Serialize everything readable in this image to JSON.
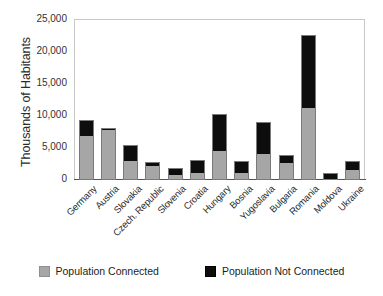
{
  "chart_data": {
    "type": "bar",
    "title": "",
    "xlabel": "",
    "ylabel": "Thousands of Habitants",
    "ylim": [
      0,
      25000
    ],
    "ytick_labels": [
      "25,000",
      "20,000",
      "15,000",
      "10,000",
      "5,000",
      "0"
    ],
    "ytick_values": [
      25000,
      20000,
      15000,
      10000,
      5000,
      0
    ],
    "grid": false,
    "stacked": true,
    "legend_position": "bottom",
    "categories": [
      "Germany",
      "Austria",
      "Slovakia",
      "Czech. Republic",
      "Slovenia",
      "Croatia",
      "Hungary",
      "Bosnia",
      "Yugoslavia",
      "Bulgaria",
      "Romania",
      "Moldova",
      "Ukraine"
    ],
    "series": [
      {
        "name": "Population Connected",
        "color": "#a6a6a6",
        "values": [
          6800,
          7800,
          2900,
          2200,
          800,
          1100,
          4500,
          1100,
          4000,
          2600,
          11200,
          0,
          1500
        ]
      },
      {
        "name": "Population Not Connected",
        "color": "#0d0d0d",
        "values": [
          2600,
          300,
          2500,
          600,
          1000,
          2100,
          5800,
          1800,
          5100,
          1300,
          11500,
          1100,
          1400
        ]
      }
    ],
    "totals": [
      9400,
      8100,
      5400,
      2800,
      1800,
      3200,
      10300,
      2900,
      9100,
      3900,
      22700,
      1100,
      2900
    ]
  },
  "legend": {
    "entries": [
      {
        "label": "Population Connected",
        "swatch": "gray"
      },
      {
        "label": "Population Not Connected",
        "swatch": "black"
      }
    ]
  }
}
